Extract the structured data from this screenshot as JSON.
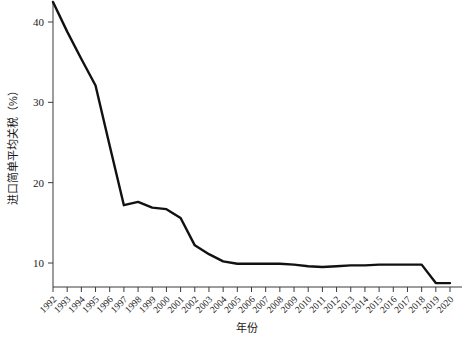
{
  "chart_data": {
    "type": "line",
    "title": "",
    "xlabel": "年份",
    "ylabel": "进口简单平均关税（%）",
    "categories": [
      "1992",
      "1993",
      "1994",
      "1995",
      "1996",
      "1997",
      "1998",
      "1999",
      "2000",
      "2001",
      "2002",
      "2003",
      "2004",
      "2005",
      "2006",
      "2007",
      "2008",
      "2009",
      "2010",
      "2011",
      "2012",
      "2013",
      "2014",
      "2015",
      "2016",
      "2017",
      "2018",
      "2019",
      "2020"
    ],
    "values": [
      42.5,
      38.8,
      35.4,
      32.1,
      24.6,
      17.2,
      17.6,
      16.9,
      16.7,
      15.6,
      12.2,
      11.1,
      10.2,
      9.9,
      9.9,
      9.9,
      9.9,
      9.8,
      9.6,
      9.5,
      9.6,
      9.7,
      9.7,
      9.8,
      9.8,
      9.8,
      9.8,
      7.5,
      7.5
    ],
    "ylim": [
      6.5,
      43.5
    ],
    "yticks": [
      10,
      20,
      30,
      40
    ],
    "ytick_labels": [
      "10",
      "20",
      "30",
      "40"
    ],
    "xlim": [
      "1992",
      "2020"
    ],
    "grid": false,
    "legend": null,
    "legend_position": "none",
    "series_color": "#111111",
    "axis_color": "#3a3a3a",
    "background_color": "#ffffff"
  }
}
